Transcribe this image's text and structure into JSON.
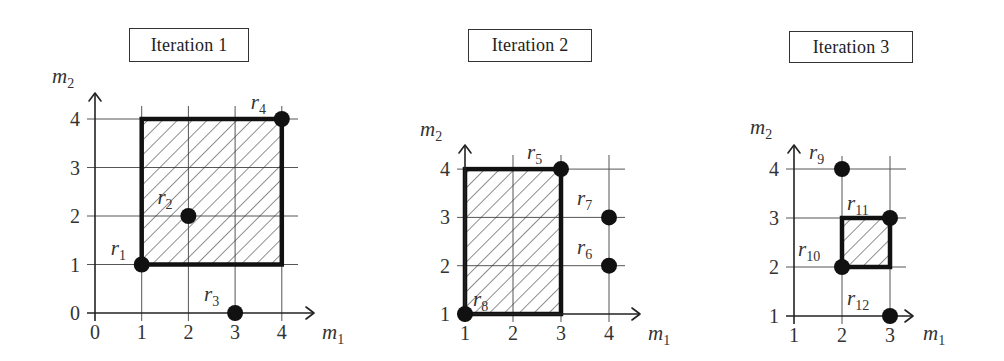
{
  "figure": {
    "hatch_color": "#333333",
    "line_color": "#111111"
  },
  "panels": [
    {
      "title": "Iteration 1",
      "title_box": {
        "x": 129,
        "y": 28,
        "w": 120,
        "h": 34
      },
      "x_axis": {
        "label": "m",
        "label_sub": "1",
        "ticks": [
          0,
          1,
          2,
          3,
          4
        ],
        "min": 0,
        "max": 4
      },
      "y_axis": {
        "label": "m",
        "label_sub": "2",
        "ticks": [
          0,
          1,
          2,
          3,
          4
        ],
        "min": 0,
        "max": 4
      },
      "origin_px": [
        95,
        313
      ],
      "unit_px": [
        46.7,
        48.5
      ],
      "axis_extent_px": {
        "x_end": 314,
        "y_end": 93,
        "grid_right": 298,
        "grid_top": 106
      },
      "y_label_pos": [
        52,
        83
      ],
      "x_label_pos": [
        322,
        339
      ],
      "region": {
        "x1": 1,
        "y1": 1,
        "x2": 4,
        "y2": 4
      },
      "points": [
        {
          "name": "r",
          "sub": "1",
          "x": 1,
          "y": 1,
          "label_dx": -31,
          "label_dy": -10
        },
        {
          "name": "r",
          "sub": "2",
          "x": 2,
          "y": 2,
          "label_dx": -31,
          "label_dy": -12
        },
        {
          "name": "r",
          "sub": "3",
          "x": 3,
          "y": 0,
          "label_dx": -31,
          "label_dy": -12
        },
        {
          "name": "r",
          "sub": "4",
          "x": 4,
          "y": 4,
          "label_dx": -31,
          "label_dy": -10
        }
      ]
    },
    {
      "title": "Iteration 2",
      "title_box": {
        "x": 468,
        "y": 29,
        "w": 124,
        "h": 33
      },
      "x_axis": {
        "label": "m",
        "label_sub": "1",
        "ticks": [
          1,
          2,
          3,
          4
        ],
        "min": 1,
        "max": 4
      },
      "y_axis": {
        "label": "m",
        "label_sub": "2",
        "ticks": [
          1,
          2,
          3,
          4
        ],
        "min": 1,
        "max": 4
      },
      "origin_px": [
        465,
        314
      ],
      "unit_px": [
        48,
        48.3
      ],
      "axis_extent_px": {
        "x_end": 640,
        "y_end": 145,
        "grid_right": 625,
        "grid_top": 155
      },
      "y_label_pos": [
        420,
        136
      ],
      "x_label_pos": [
        648,
        340
      ],
      "region": {
        "x1": 1,
        "y1": 1,
        "x2": 3,
        "y2": 4
      },
      "points": [
        {
          "name": "r",
          "sub": "5",
          "x": 3,
          "y": 4,
          "label_dx": -34,
          "label_dy": -10
        },
        {
          "name": "r",
          "sub": "6",
          "x": 4,
          "y": 2,
          "label_dx": -32,
          "label_dy": -12
        },
        {
          "name": "r",
          "sub": "7",
          "x": 4,
          "y": 3,
          "label_dx": -32,
          "label_dy": -12
        },
        {
          "name": "r",
          "sub": "8",
          "x": 1,
          "y": 1,
          "label_dx": 8,
          "label_dy": -8
        }
      ]
    },
    {
      "title": "Iteration 3",
      "title_box": {
        "x": 789,
        "y": 31,
        "w": 124,
        "h": 32
      },
      "x_axis": {
        "label": "m",
        "label_sub": "1",
        "ticks": [
          1,
          2,
          3
        ],
        "min": 1,
        "max": 3
      },
      "y_axis": {
        "label": "m",
        "label_sub": "2",
        "ticks": [
          1,
          2,
          3,
          4
        ],
        "min": 1,
        "max": 4
      },
      "origin_px": [
        794,
        316
      ],
      "unit_px": [
        48,
        49
      ],
      "axis_extent_px": {
        "x_end": 913,
        "y_end": 145,
        "grid_right": 906,
        "grid_top": 156
      },
      "y_label_pos": [
        750,
        134
      ],
      "x_label_pos": [
        923,
        340
      ],
      "region": {
        "x1": 2,
        "y1": 2,
        "x2": 3,
        "y2": 3
      },
      "points": [
        {
          "name": "r",
          "sub": "9",
          "x": 2,
          "y": 4,
          "label_dx": -33,
          "label_dy": -10
        },
        {
          "name": "r",
          "sub": "10",
          "x": 2,
          "y": 2,
          "label_dx": -44,
          "label_dy": -11
        },
        {
          "name": "r",
          "sub": "11",
          "x": 3,
          "y": 3,
          "label_dx": -43,
          "label_dy": -8
        },
        {
          "name": "r",
          "sub": "12",
          "x": 3,
          "y": 1,
          "label_dx": -43,
          "label_dy": -11
        }
      ]
    }
  ]
}
